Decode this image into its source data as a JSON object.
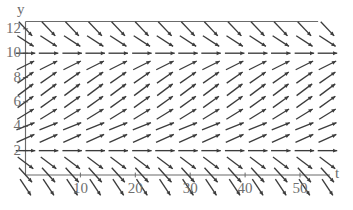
{
  "figure": {
    "kind": "slope-field",
    "axis_labels": {
      "x": "t",
      "y": "y"
    },
    "line_color": "#6b6b6b",
    "arrow_color": "#3c3c3c",
    "background": "#ffffff"
  },
  "chart_data": {
    "type": "scatter",
    "title": "",
    "xlabel": "t",
    "ylabel": "y",
    "xlim": [
      0,
      55
    ],
    "ylim": [
      0,
      13
    ],
    "grid": false,
    "legend": null,
    "xticks": [
      10,
      20,
      30,
      40,
      50
    ],
    "yticks": [
      2,
      4,
      6,
      8,
      10,
      12
    ],
    "xtick_labels": [
      "10",
      "20",
      "30",
      "40",
      "50"
    ],
    "ytick_labels": [
      "2",
      "4",
      "6",
      "8",
      "10",
      "12"
    ],
    "field": {
      "description": "direction field of an autonomous ODE dy/dt = f(y) with equilibria at y = 2 and y = 10",
      "equilibria": [
        2,
        10
      ],
      "columns": 14,
      "rows": 13,
      "x_samples": [
        0,
        4.2,
        8.5,
        12.7,
        16.9,
        21.2,
        25.4,
        29.6,
        33.8,
        38.1,
        42.3,
        46.5,
        50.8,
        55
      ],
      "y_samples": [
        -1,
        0,
        1,
        2,
        3,
        4,
        5,
        6,
        7,
        8,
        9,
        10,
        11,
        12
      ],
      "slope_by_y": {
        "-1": -1.5,
        "0": -1.1,
        "1": -0.75,
        "2": 0,
        "3": 0.45,
        "4": 0.4,
        "5": 0.62,
        "6": 0.72,
        "7": 0.75,
        "8": 0.7,
        "9": 0.5,
        "10": 0,
        "11": -0.65,
        "12": -1.05
      }
    }
  }
}
